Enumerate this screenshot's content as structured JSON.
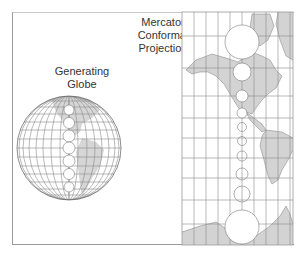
{
  "labels": {
    "globe": [
      "Generating",
      "Globe"
    ],
    "mercator": [
      "Mercator",
      "Conformal",
      "Projection"
    ]
  },
  "colors": {
    "land": "#d3d3d3",
    "grid": "#8c8c8c",
    "frame": "#9a9a9a",
    "text": "#333333"
  },
  "globe": {
    "cx": 69,
    "cy": 178,
    "r": 52,
    "tissot_circles_y": [
      118,
      138,
      158,
      178,
      198
    ]
  },
  "mercator": {
    "x": 182,
    "y": 12,
    "width": 111,
    "height": 233,
    "meridians_x": [
      194,
      206,
      218,
      230,
      242,
      254,
      266,
      278,
      290
    ],
    "parallels_y": [
      36,
      68,
      96,
      118,
      138,
      158,
      178,
      200,
      224
    ],
    "tissot_circles": [
      {
        "cy": 42,
        "r": 17
      },
      {
        "cy": 72,
        "r": 9
      },
      {
        "cy": 96,
        "r": 6
      },
      {
        "cy": 113,
        "r": 5
      },
      {
        "cy": 126,
        "r": 4.5
      },
      {
        "cy": 141,
        "r": 4.5
      },
      {
        "cy": 156,
        "r": 5
      },
      {
        "cy": 175,
        "r": 6
      },
      {
        "cy": 193,
        "r": 8
      },
      {
        "cy": 226,
        "r": 17
      }
    ]
  }
}
